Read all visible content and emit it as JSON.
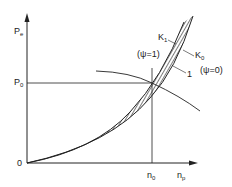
{
  "diagram": {
    "axes": {
      "y_label": "P",
      "y_label_sub": "e",
      "x_label": "n",
      "x_label_sub": "p",
      "origin_label": "0"
    },
    "reference": {
      "p0_label": "P",
      "p0_sub": "0",
      "n0_label": "n",
      "n0_sub": "0"
    },
    "curves": {
      "k1_label": "K",
      "k1_sub": "1",
      "k0_label": "K",
      "k0_sub": "0",
      "psi1_label": "(ψ=1)",
      "psi0_label": "(ψ=0)",
      "curve1_label": "1"
    },
    "colors": {
      "line": "#222222",
      "background": "#ffffff"
    }
  }
}
